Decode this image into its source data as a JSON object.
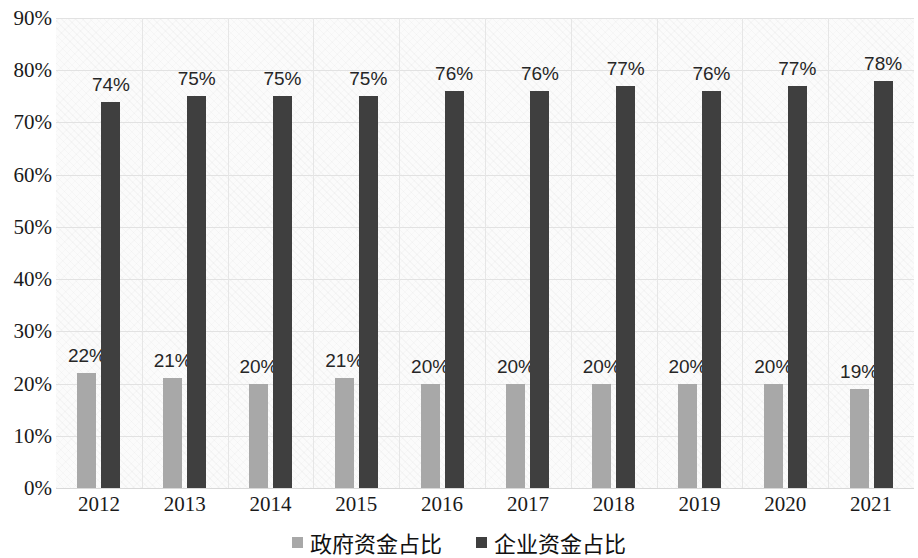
{
  "chart_data": {
    "type": "bar",
    "title": "",
    "xlabel": "",
    "ylabel": "",
    "ylim": [
      0,
      0.9
    ],
    "grid": true,
    "legend_position": "bottom",
    "categories": [
      "2012",
      "2013",
      "2014",
      "2015",
      "2016",
      "2017",
      "2018",
      "2019",
      "2020",
      "2021"
    ],
    "y_ticks": [
      "0%",
      "10%",
      "20%",
      "30%",
      "40%",
      "50%",
      "60%",
      "70%",
      "80%",
      "90%"
    ],
    "y_tick_values": [
      0,
      10,
      20,
      30,
      40,
      50,
      60,
      70,
      80,
      90
    ],
    "series": [
      {
        "name": "政府资金占比",
        "color": "#a8a8a8",
        "values": [
          22,
          21,
          20,
          21,
          20,
          20,
          20,
          20,
          20,
          19
        ],
        "labels": [
          "22%",
          "21%",
          "20%",
          "21%",
          "20%",
          "20%",
          "20%",
          "20%",
          "20%",
          "19%"
        ]
      },
      {
        "name": "企业资金占比",
        "color": "#3f3f3f",
        "values": [
          74,
          75,
          75,
          75,
          76,
          76,
          77,
          76,
          77,
          78
        ],
        "labels": [
          "74%",
          "75%",
          "75%",
          "75%",
          "76%",
          "76%",
          "77%",
          "76%",
          "77%",
          "78%"
        ]
      }
    ]
  },
  "legend": {
    "items": [
      {
        "label": "政府资金占比",
        "color": "#a8a8a8"
      },
      {
        "label": "企业资金占比",
        "color": "#3f3f3f"
      }
    ]
  },
  "colors": {
    "series_gov": "#a8a8a8",
    "series_ent": "#3f3f3f",
    "gridline": "#e2e2e2",
    "plot_background": "#fbfbfb",
    "text": "#1a1a1a"
  }
}
